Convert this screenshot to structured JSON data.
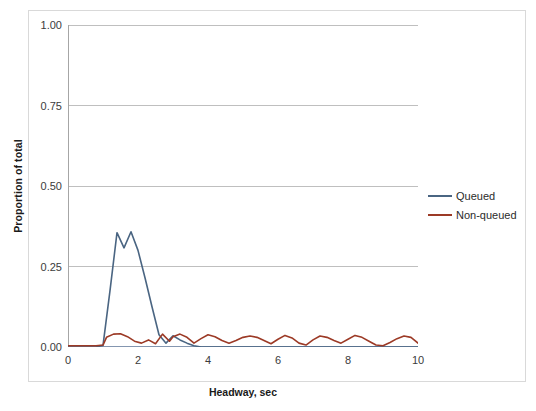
{
  "chart_data": {
    "type": "line",
    "title": "",
    "xlabel": "Headway, sec",
    "ylabel": "Proportion of total",
    "xlim": [
      0,
      10
    ],
    "ylim": [
      0,
      1.0
    ],
    "xticks": [
      0,
      2,
      4,
      6,
      8,
      10
    ],
    "xtick_labels": [
      "0",
      "2",
      "4",
      "6",
      "8",
      "10"
    ],
    "yticks": [
      0.0,
      0.25,
      0.5,
      0.75,
      1.0
    ],
    "ytick_labels": [
      "0.00",
      "0.25",
      "0.50",
      "0.75",
      "1.00"
    ],
    "grid": "horizontal-major",
    "legend_position": "right",
    "minor_ticks_y": true,
    "series": [
      {
        "name": "Queued",
        "color": "#4A6582",
        "x": [
          0.0,
          0.2,
          0.4,
          0.6,
          0.8,
          1.0,
          1.2,
          1.4,
          1.6,
          1.8,
          2.0,
          2.2,
          2.4,
          2.6,
          2.8,
          3.0,
          3.2,
          3.4,
          3.6,
          3.8,
          4.0,
          4.5,
          5.0,
          5.5,
          6.0,
          6.5,
          7.0,
          7.5,
          8.0,
          8.5,
          9.0,
          9.5,
          10.0
        ],
        "values": [
          0.0,
          0.0,
          0.0,
          0.0,
          0.0,
          0.005,
          0.175,
          0.355,
          0.308,
          0.358,
          0.3,
          0.215,
          0.125,
          0.038,
          0.012,
          0.035,
          0.022,
          0.012,
          0.004,
          0.0,
          0.0,
          0.0,
          0.0,
          0.0,
          0.0,
          0.0,
          0.0,
          0.0,
          0.0,
          0.0,
          0.0,
          0.0,
          0.0
        ]
      },
      {
        "name": "Non-queued",
        "color": "#9C3A26",
        "x": [
          0.0,
          0.2,
          0.4,
          0.6,
          0.8,
          1.0,
          1.1,
          1.3,
          1.5,
          1.7,
          1.9,
          2.1,
          2.3,
          2.5,
          2.7,
          2.9,
          3.0,
          3.2,
          3.4,
          3.6,
          3.8,
          4.0,
          4.2,
          4.4,
          4.6,
          4.8,
          5.0,
          5.2,
          5.4,
          5.6,
          5.8,
          6.0,
          6.2,
          6.4,
          6.6,
          6.8,
          7.0,
          7.2,
          7.4,
          7.6,
          7.8,
          8.0,
          8.2,
          8.4,
          8.6,
          8.8,
          9.0,
          9.2,
          9.4,
          9.6,
          9.8,
          10.0
        ],
        "values": [
          0.004,
          0.004,
          0.004,
          0.004,
          0.004,
          0.006,
          0.03,
          0.04,
          0.041,
          0.032,
          0.018,
          0.012,
          0.022,
          0.01,
          0.04,
          0.018,
          0.032,
          0.04,
          0.03,
          0.012,
          0.026,
          0.038,
          0.032,
          0.02,
          0.012,
          0.02,
          0.03,
          0.034,
          0.03,
          0.02,
          0.01,
          0.024,
          0.036,
          0.028,
          0.012,
          0.006,
          0.022,
          0.034,
          0.03,
          0.02,
          0.012,
          0.024,
          0.036,
          0.03,
          0.018,
          0.006,
          0.004,
          0.014,
          0.026,
          0.034,
          0.03,
          0.012
        ]
      }
    ]
  },
  "legend": {
    "items": [
      {
        "label": "Queued",
        "color": "#4A6582"
      },
      {
        "label": "Non-queued",
        "color": "#9C3A26"
      }
    ]
  }
}
